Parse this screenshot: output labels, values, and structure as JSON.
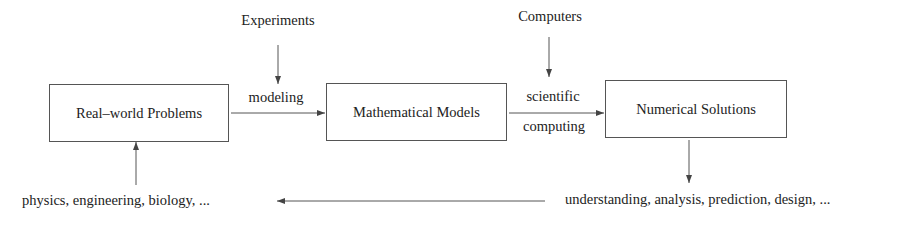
{
  "diagram": {
    "nodes": [
      {
        "id": "real_world",
        "label": "Real–world Problems"
      },
      {
        "id": "math_models",
        "label": "Mathematical Models"
      },
      {
        "id": "numerical",
        "label": "Numerical Solutions"
      }
    ],
    "inputs": {
      "experiments": "Experiments",
      "computers": "Computers"
    },
    "edges": {
      "modeling": "modeling",
      "scientific": "scientific",
      "computing": "computing"
    },
    "bottom": {
      "applications": "physics, engineering, biology, ...",
      "outcomes": "understanding, analysis, prediction, design, ..."
    },
    "colors": {
      "stroke": "#555555",
      "text": "#222222",
      "background": "#ffffff"
    }
  }
}
